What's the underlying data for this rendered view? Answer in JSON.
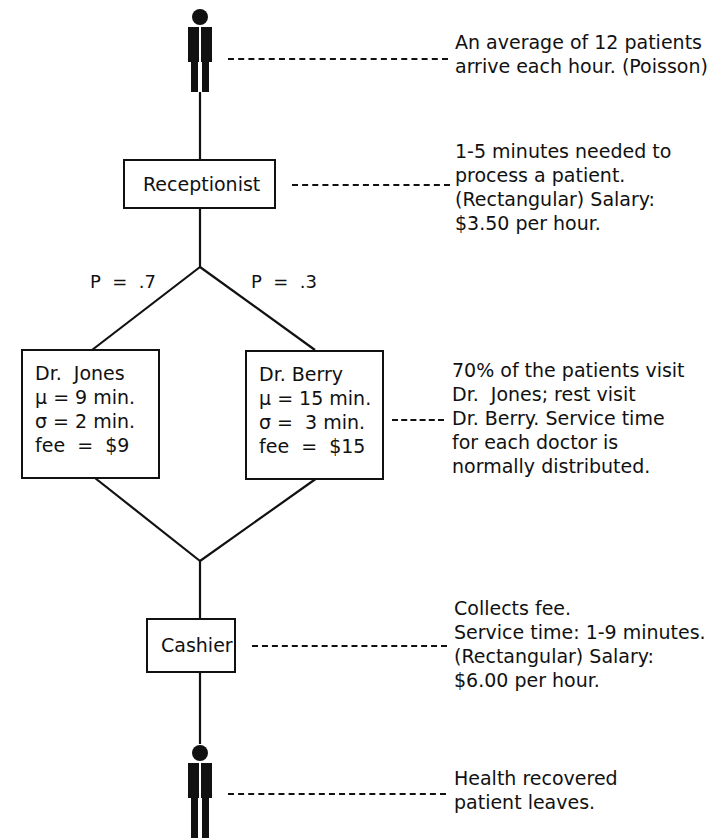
{
  "diagram": {
    "type": "queueing-flow",
    "colors": {
      "ink": "#111111",
      "background": "#ffffff"
    },
    "arrival": {
      "icon": "person-icon",
      "note": [
        "An average of 12 patients",
        "arrive each hour. (Poisson)"
      ]
    },
    "receptionist": {
      "label": "Receptionist",
      "note": [
        "1-5 minutes needed to",
        "process a patient.",
        "(Rectangular) Salary:",
        "$3.50 per hour."
      ]
    },
    "branch": {
      "left_prob": "P  =  .7",
      "right_prob": "P  =  .3"
    },
    "doctors": [
      {
        "name": "Dr.  Jones",
        "mu": "μ = 9 min.",
        "sigma": "σ = 2 min.",
        "fee": "fee  =  $9"
      },
      {
        "name": "Dr. Berry",
        "mu": "μ = 15 min.",
        "sigma": "σ =  3 min.",
        "fee": "fee  =  $15"
      }
    ],
    "doctors_note": [
      "70% of the patients visit",
      "Dr.  Jones; rest visit",
      "Dr. Berry. Service time",
      "for each doctor is",
      "normally distributed."
    ],
    "cashier": {
      "label": "Cashier",
      "note": [
        "Collects fee.",
        "Service time: 1-9 minutes.",
        "(Rectangular) Salary:",
        "$6.00 per hour."
      ]
    },
    "departure": {
      "icon": "person-icon",
      "note": [
        "Health recovered",
        "patient leaves."
      ]
    }
  }
}
